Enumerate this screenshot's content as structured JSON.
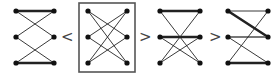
{
  "diagram": {
    "colors": {
      "edge": "#222222",
      "edge_gray": "#777777",
      "node": "#111111",
      "box": "#555555",
      "relation": "#444444"
    },
    "relations": [
      {
        "symbol": "<",
        "x": 66,
        "y": 42
      },
      {
        "symbol": ">",
        "x": 144,
        "y": 42
      },
      {
        "symbol": ">",
        "x": 214,
        "y": 42
      }
    ],
    "graphs": [
      {
        "id": "g1",
        "boxed": false,
        "left_x": 16,
        "right_x": 54,
        "rows_y": [
          11,
          37,
          63
        ],
        "edges": [
          {
            "from": "L1",
            "to": "R1",
            "weight": "thick"
          },
          {
            "from": "L3",
            "to": "R3",
            "weight": "thick"
          },
          {
            "from": "L1",
            "to": "R2",
            "weight": "thin"
          },
          {
            "from": "R1",
            "to": "L2",
            "weight": "thin"
          },
          {
            "from": "L2",
            "to": "R3",
            "weight": "thin"
          },
          {
            "from": "R2",
            "to": "L3",
            "weight": "thin"
          }
        ]
      },
      {
        "id": "g2",
        "boxed": true,
        "box": {
          "x": 79,
          "y": 3,
          "w": 56,
          "h": 69
        },
        "left_x": 88,
        "right_x": 127,
        "rows_y": [
          11,
          37,
          63
        ],
        "edges": [
          {
            "from": "L1",
            "to": "R2",
            "weight": "thin"
          },
          {
            "from": "L1",
            "to": "R3",
            "weight": "thin"
          },
          {
            "from": "R1",
            "to": "L2",
            "weight": "thin"
          },
          {
            "from": "R1",
            "to": "L3",
            "weight": "thin"
          },
          {
            "from": "L2",
            "to": "R3",
            "weight": "thin"
          },
          {
            "from": "R2",
            "to": "L3",
            "weight": "thin"
          }
        ]
      },
      {
        "id": "g3",
        "boxed": false,
        "left_x": 160,
        "right_x": 200,
        "rows_y": [
          11,
          37,
          63
        ],
        "edges": [
          {
            "from": "L1",
            "to": "R1",
            "weight": "thick"
          },
          {
            "from": "L2",
            "to": "R2",
            "weight": "thick"
          },
          {
            "from": "L1",
            "to": "R3",
            "weight": "thin"
          },
          {
            "from": "R1",
            "to": "L3",
            "weight": "thin"
          },
          {
            "from": "L2",
            "to": "R3",
            "weight": "thin"
          },
          {
            "from": "R2",
            "to": "L3",
            "weight": "thin"
          }
        ]
      },
      {
        "id": "g4",
        "boxed": false,
        "left_x": 228,
        "right_x": 268,
        "rows_y": [
          11,
          37,
          63
        ],
        "edges": [
          {
            "from": "L1",
            "to": "R1",
            "weight": "thin"
          },
          {
            "from": "L1",
            "to": "R2",
            "weight": "thick"
          },
          {
            "from": "L2",
            "to": "R2",
            "weight": "gray"
          },
          {
            "from": "R1",
            "to": "L3",
            "weight": "thin"
          },
          {
            "from": "L2",
            "to": "R3",
            "weight": "thin"
          },
          {
            "from": "L3",
            "to": "R3",
            "weight": "thick"
          }
        ]
      }
    ]
  }
}
